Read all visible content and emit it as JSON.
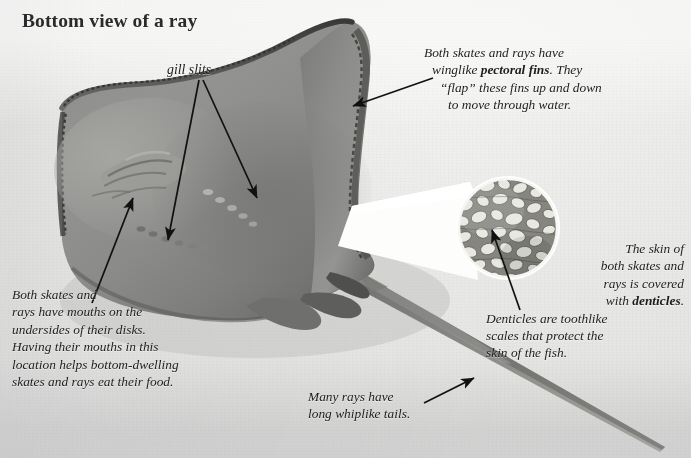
{
  "figure": {
    "title": "Bottom view of a ray",
    "background_color": "#e9e9e7",
    "body_color": "#8a8a88",
    "ink_color": "#1d1d1d"
  },
  "labels": {
    "gill_slits": "gill slits"
  },
  "callouts": {
    "pectoral_fins": {
      "name": "pectoral-fins-callout",
      "lines": [
        "Both skates and rays have",
        "winglike pectoral fins. They",
        "“flap” these fins up and down",
        "to move through water."
      ],
      "bold_terms": [
        "pectoral fins"
      ]
    },
    "mouths": {
      "name": "mouth-callout",
      "lines": [
        "Both skates and",
        "rays have mouths on the",
        "undersides of their disks.",
        "Having their mouths in this",
        "location helps bottom-dwelling",
        "skates and rays eat their food."
      ],
      "bold_terms": []
    },
    "denticles": {
      "name": "denticles-callout",
      "lines_right": [
        "The skin of",
        "both skates and",
        "rays is covered",
        "with denticles."
      ],
      "lines_left": [
        "Denticles are toothlike",
        "scales that protect the",
        "skin of the fish."
      ],
      "bold_terms": [
        "denticles"
      ]
    },
    "tail": {
      "name": "tail-callout",
      "lines": [
        "Many rays have",
        "long whiplike tails."
      ],
      "bold_terms": []
    }
  },
  "inset": {
    "name": "denticles-magnifier-inset",
    "shape": "circle",
    "depicts": "close-up of denticles (toothlike skin scales)"
  },
  "arrows": [
    {
      "name": "arrow-gill-slit-upper",
      "from": "gill slits label",
      "to": "upper gill slit row"
    },
    {
      "name": "arrow-gill-slit-lower",
      "from": "gill slits label",
      "to": "lower gill slit row"
    },
    {
      "name": "arrow-pectoral-fin",
      "from": "pectoral fins callout",
      "to": "right pectoral fin"
    },
    {
      "name": "arrow-mouth",
      "from": "mouth callout",
      "to": "mouth on underside"
    },
    {
      "name": "arrow-denticles",
      "from": "denticles callout",
      "to": "magnified denticle"
    },
    {
      "name": "arrow-tail",
      "from": "tail callout",
      "to": "whiplike tail"
    }
  ]
}
